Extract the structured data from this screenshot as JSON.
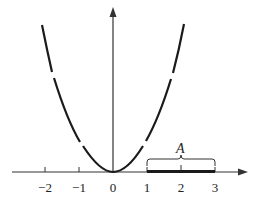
{
  "figure": {
    "set_label": "A",
    "x_ticks": [
      "−2",
      "−1",
      "0",
      "1",
      "2",
      "3"
    ],
    "interval": {
      "start": 1,
      "end": 3
    },
    "colors": {
      "stroke": "#1a1a1a",
      "background": "#ffffff"
    }
  }
}
